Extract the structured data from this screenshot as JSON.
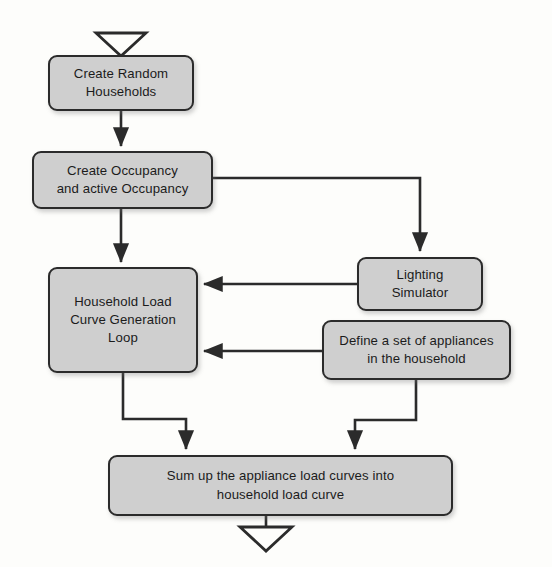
{
  "diagram": {
    "style": {
      "node_fill": "#cfcfcf",
      "node_border": "#2b2b2b",
      "connector": "#2b2b2b",
      "background": "#fdfdfb"
    },
    "nodes": [
      {
        "id": "create-households",
        "label": "Create Random\nHouseholds"
      },
      {
        "id": "create-occupancy",
        "label": "Create Occupancy\nand active Occupancy"
      },
      {
        "id": "load-curve-loop",
        "label": "Household Load\nCurve Generation\nLoop"
      },
      {
        "id": "lighting-simulator",
        "label": "Lighting\nSimulator"
      },
      {
        "id": "define-appliances",
        "label": "Define a set of appliances\nin the household"
      },
      {
        "id": "sum-load-curves",
        "label": "Sum up the appliance load curves into\nhousehold load curve"
      }
    ],
    "markers": {
      "start": "open-down-triangle",
      "end": "open-down-triangle"
    },
    "connectors": [
      {
        "from": "start-marker",
        "to": "create-households",
        "kind": "straight-down"
      },
      {
        "from": "create-households",
        "to": "create-occupancy",
        "kind": "straight-down"
      },
      {
        "from": "create-occupancy",
        "to": "load-curve-loop",
        "kind": "straight-down"
      },
      {
        "from": "create-occupancy",
        "to": "lighting-simulator",
        "kind": "right-then-down"
      },
      {
        "from": "lighting-simulator",
        "to": "load-curve-loop",
        "kind": "left-into-right-side"
      },
      {
        "from": "define-appliances",
        "to": "load-curve-loop",
        "kind": "left-into-right-side"
      },
      {
        "from": "load-curve-loop",
        "to": "sum-load-curves",
        "kind": "down-right-down"
      },
      {
        "from": "define-appliances",
        "to": "sum-load-curves",
        "kind": "down-left-down"
      },
      {
        "from": "sum-load-curves",
        "to": "end-marker",
        "kind": "straight-down"
      }
    ]
  }
}
